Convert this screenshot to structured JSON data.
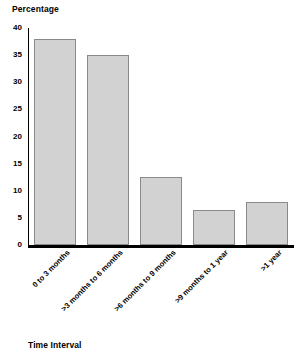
{
  "chart_data": {
    "type": "bar",
    "title": "",
    "subtitle": "",
    "xlabel": "Time Interval",
    "ylabel": "Percentage",
    "categories": [
      "0 to 3 months",
      ">3 months to 6 months",
      ">6 months to 9 months",
      ">9 months to 1 year",
      ">1 year"
    ],
    "values": [
      38,
      35,
      12.5,
      6.5,
      8
    ],
    "ylim": [
      0,
      40
    ],
    "ytick_labels": [
      "0",
      "5",
      "10",
      "15",
      "20",
      "25",
      "30",
      "35",
      "40"
    ],
    "ytick_values": [
      0,
      5,
      10,
      15,
      20,
      25,
      30,
      35,
      40
    ],
    "grid": false,
    "legend": null,
    "legend_position": "none",
    "bar_fill_color": "#d2d2d2",
    "bar_border_color": "#8a8a8a",
    "axis_color": "#000000",
    "background_color": "#ffffff",
    "xtick_rotation_degrees": 45
  }
}
